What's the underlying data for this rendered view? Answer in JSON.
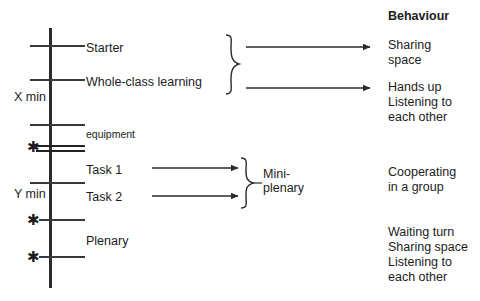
{
  "diagram": {
    "title_column": "Behaviour",
    "timeline": {
      "duration_labels": [
        {
          "text": "X min",
          "x": 14,
          "y": 90
        },
        {
          "text": "Y min",
          "x": 14,
          "y": 187
        }
      ],
      "markers": [
        {
          "name": "asterisk-equipment",
          "symbol": "✱",
          "x": 27,
          "y": 139
        },
        {
          "name": "asterisk-mid",
          "symbol": "✱",
          "x": 27,
          "y": 212
        },
        {
          "name": "asterisk-plenary",
          "symbol": "✱",
          "x": 27,
          "y": 249
        }
      ],
      "segments": [
        {
          "label": "Starter",
          "x": 86,
          "y": 41
        },
        {
          "label": "Whole-class learning",
          "x": 86,
          "y": 75
        },
        {
          "label": "equipment",
          "x": 86,
          "y": 128,
          "small": true
        },
        {
          "label": "Task 1",
          "x": 86,
          "y": 163
        },
        {
          "label": "Task 2",
          "x": 86,
          "y": 190
        },
        {
          "label": "Plenary",
          "x": 86,
          "y": 234
        }
      ]
    },
    "group_labels": [
      {
        "text": "Mini-",
        "x": 263,
        "y": 167
      },
      {
        "text": "plenary",
        "x": 263,
        "y": 181
      }
    ],
    "behaviour_column": {
      "heading": {
        "text": "Behaviour",
        "x": 388,
        "y": 9
      },
      "entries": [
        {
          "lines": [
            "Sharing",
            "space"
          ],
          "x": 388,
          "y": 38
        },
        {
          "lines": [
            "Hands up",
            "Listening to",
            "each other"
          ],
          "x": 388,
          "y": 80
        },
        {
          "lines": [
            "Cooperating",
            "in a group"
          ],
          "x": 388,
          "y": 165
        },
        {
          "lines": [
            "Waiting turn",
            "Sharing space",
            "Listening to",
            "each other"
          ],
          "x": 388,
          "y": 225
        }
      ]
    }
  }
}
